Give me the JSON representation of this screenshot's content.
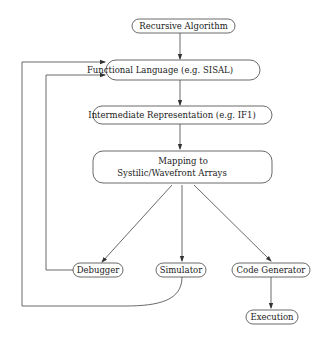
{
  "diagram": {
    "nodes": {
      "recursive": "Recursive Algorithm",
      "functional": "Functional Language (e.g. SISAL)",
      "intermediate": "Intermediate Representation (e.g. IF1)",
      "mapping_line1": "Mapping to",
      "mapping_line2": "Systilic/Wavefront Arrays",
      "debugger": "Debugger",
      "simulator": "Simulator",
      "codegen": "Code Generator",
      "execution": "Execution"
    },
    "edges": [
      {
        "from": "Recursive Algorithm",
        "to": "Functional Language (e.g. SISAL)"
      },
      {
        "from": "Functional Language (e.g. SISAL)",
        "to": "Intermediate Representation (e.g. IF1)"
      },
      {
        "from": "Intermediate Representation (e.g. IF1)",
        "to": "Mapping to Systilic/Wavefront Arrays"
      },
      {
        "from": "Mapping to Systilic/Wavefront Arrays",
        "to": "Debugger"
      },
      {
        "from": "Mapping to Systilic/Wavefront Arrays",
        "to": "Simulator"
      },
      {
        "from": "Mapping to Systilic/Wavefront Arrays",
        "to": "Code Generator"
      },
      {
        "from": "Code Generator",
        "to": "Execution"
      },
      {
        "from": "Debugger",
        "to": "Functional Language (e.g. SISAL)"
      },
      {
        "from": "Simulator",
        "to": "Functional Language (e.g. SISAL)"
      }
    ],
    "colors": {
      "stroke": "#333333",
      "text": "#1a1a1a",
      "background": "#ffffff"
    }
  }
}
